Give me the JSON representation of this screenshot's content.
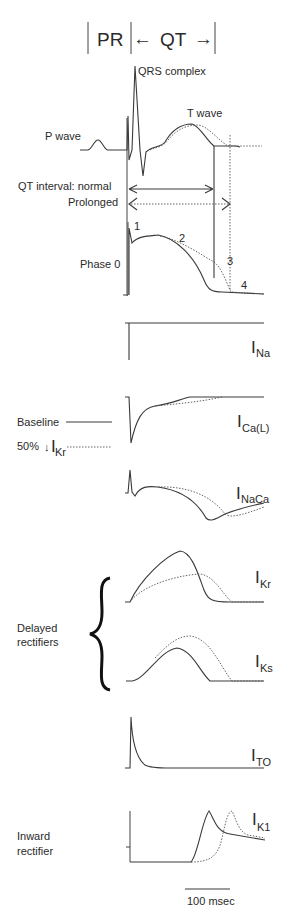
{
  "header": {
    "pr_label": "PR",
    "qt_label": "QT",
    "qt_left_arrow": "←",
    "qt_right_arrow": "→"
  },
  "ecg": {
    "qrs_label": "QRS  complex",
    "t_wave_label": "T wave",
    "p_wave_label": "P wave",
    "qt_normal_label": "QT interval: normal",
    "qt_prolonged_label": "Prolonged"
  },
  "action_potential": {
    "phase0_label": "Phase 0",
    "phase1": "1",
    "phase2": "2",
    "phase3": "3",
    "phase4": "4"
  },
  "legend": {
    "baseline_label": "Baseline",
    "reduced_label_prefix": "50%",
    "reduced_arrow": "↓",
    "reduced_current": "I",
    "reduced_current_sub": "Kr"
  },
  "currents": [
    {
      "main": "I",
      "sub": "Na"
    },
    {
      "main": "I",
      "sub": "Ca(L)"
    },
    {
      "main": "I",
      "sub": "NaCa"
    },
    {
      "main": "I",
      "sub": "Kr"
    },
    {
      "main": "I",
      "sub": "Ks"
    },
    {
      "main": "I",
      "sub": "TO"
    },
    {
      "main": "I",
      "sub": "K1"
    }
  ],
  "groups": {
    "delayed_line1": "Delayed",
    "delayed_line2": "rectifiers",
    "inward_line1": "Inward",
    "inward_line2": "rectifier"
  },
  "scale_bar": {
    "label": "100 msec"
  },
  "colors": {
    "trace": "#3a3a3a",
    "dotted_trace": "#555555",
    "background": "#ffffff"
  }
}
